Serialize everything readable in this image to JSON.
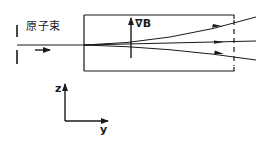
{
  "diagram": {
    "labels": {
      "atom_beam": "原子束",
      "gradient_b": "∇B",
      "z_axis": "z",
      "y_axis": "y"
    },
    "colors": {
      "ink": "#1a1a1a",
      "background": "#ffffff"
    },
    "elements": {
      "slit": "collimating slit",
      "magnet_region": "inhomogeneous magnetic field region",
      "beam_paths": [
        "deflected-up",
        "undeflected",
        "deflected-down"
      ],
      "detector": "dashed detector plane"
    }
  }
}
